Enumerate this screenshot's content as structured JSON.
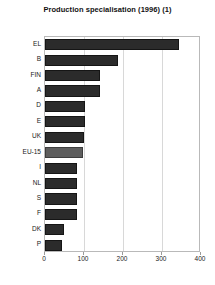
{
  "chart_data": {
    "type": "bar",
    "orientation": "horizontal",
    "title": "Production specialisation (1996) (1)",
    "xlabel": "",
    "ylabel": "",
    "categories": [
      "EL",
      "B",
      "FIN",
      "A",
      "D",
      "E",
      "UK",
      "EU-15",
      "I",
      "NL",
      "S",
      "F",
      "DK",
      "P"
    ],
    "values": [
      344,
      187,
      141,
      140,
      103,
      103,
      101,
      98,
      83,
      83,
      82,
      82,
      49,
      44
    ],
    "highlight_category": "EU-15",
    "xlim": [
      0,
      400
    ],
    "xticks": [
      0,
      100,
      200,
      300,
      400
    ],
    "xtick_labels": [
      "0",
      "100",
      "200",
      "300",
      "400"
    ],
    "gridlines": [
      100,
      200,
      300
    ],
    "grid": true,
    "legend": false,
    "colors": {
      "bar": "#2b2b2b",
      "bar_highlight": "#5d5d5d",
      "gridline": "#d8d8d8",
      "frame": "#b9b9b9",
      "text": "#1a1a1a",
      "background": "#ffffff"
    }
  }
}
